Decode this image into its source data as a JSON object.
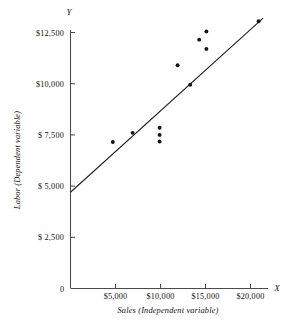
{
  "chart_data": {
    "type": "scatter",
    "title": "",
    "xlabel": "Sales (Independent variable)",
    "ylabel": "Labor (Dependent variable)",
    "x_axis_name": "X",
    "y_axis_name": "Y",
    "origin_label": "0",
    "grid": false,
    "legend": null,
    "xlim": [
      0,
      22500
    ],
    "ylim": [
      0,
      15000
    ],
    "xticks": [
      5000,
      10000,
      15000,
      20000
    ],
    "yticks": [
      2500,
      5000,
      7500,
      10000,
      12500,
      15000
    ],
    "xtick_labels": [
      "$5,000",
      "$10,000",
      "$15,000",
      "$20,000"
    ],
    "ytick_labels": [
      "$ 2,500",
      "$ 5,000",
      "$ 7,500",
      "$10,000",
      "$12,500",
      "$15,000"
    ],
    "points": [
      {
        "x": 4700,
        "y": 7150
      },
      {
        "x": 6900,
        "y": 7600
      },
      {
        "x": 9900,
        "y": 7850
      },
      {
        "x": 9900,
        "y": 7500
      },
      {
        "x": 9900,
        "y": 7180
      },
      {
        "x": 11900,
        "y": 10900
      },
      {
        "x": 13300,
        "y": 9950
      },
      {
        "x": 14300,
        "y": 12150
      },
      {
        "x": 15100,
        "y": 12550
      },
      {
        "x": 15100,
        "y": 11700
      },
      {
        "x": 20900,
        "y": 13050
      }
    ],
    "trendline": {
      "label": "regression line",
      "x_start": 0,
      "y_start": 4700,
      "x_end": 21400,
      "y_end": 13200
    }
  }
}
